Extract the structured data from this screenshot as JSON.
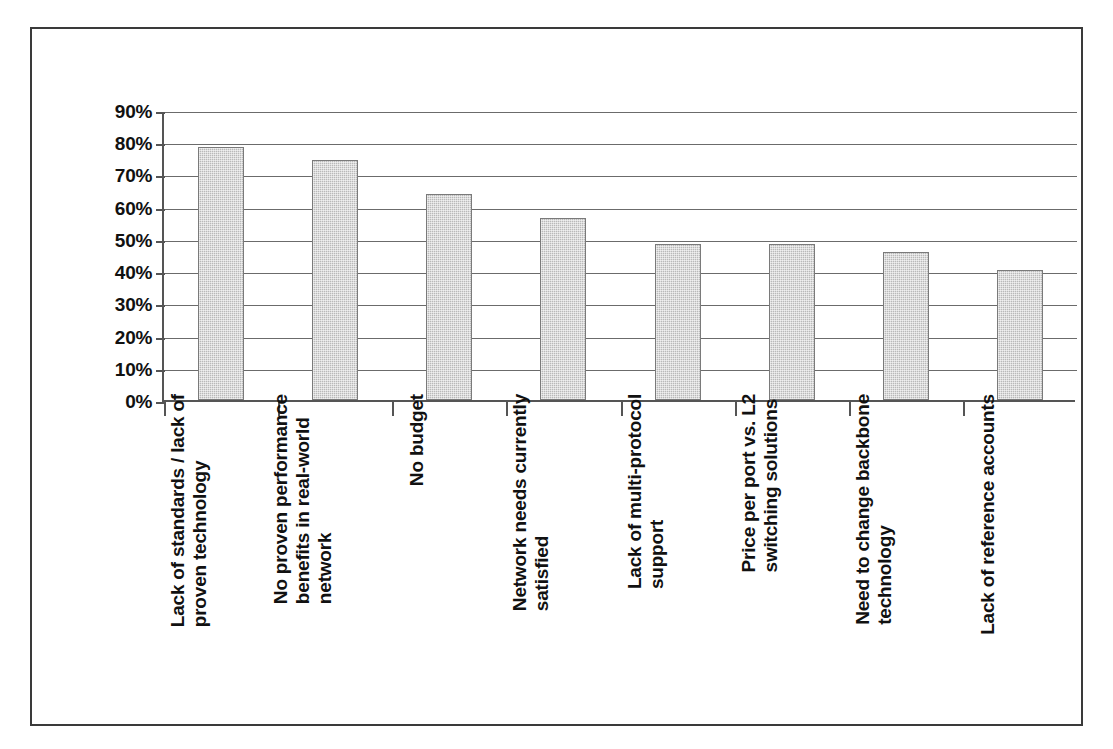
{
  "chart_data": {
    "type": "bar",
    "title": "",
    "subtitle": "",
    "xlabel": "",
    "ylabel": "",
    "ylim": [
      0,
      90
    ],
    "grid": true,
    "legend_position": "none",
    "orientation": "vertical",
    "bar_color": "#b9b9b9",
    "bar_border_color": "#7a7a7a",
    "axis_color": "#555555",
    "frame_color": "#3a3a3a",
    "ytick_labels": [
      "90%",
      "80%",
      "70%",
      "60%",
      "50%",
      "40%",
      "30%",
      "20%",
      "10%",
      "0%"
    ],
    "ytick_values": [
      90,
      80,
      70,
      60,
      50,
      40,
      30,
      20,
      10,
      0
    ],
    "categories": [
      "Lack of standards / lack of proven technology",
      "No proven performance benefits in real-world network",
      "No budget",
      "Network needs currently satisfied",
      "Lack of multi-protocol support",
      "Price per port vs. L2 switching solutions",
      "Need to change backbone technology",
      "Lack of reference accounts"
    ],
    "category_lines": [
      [
        "Lack of standards / lack of",
        "proven technology"
      ],
      [
        "No proven performance",
        "benefits in real-world",
        "network"
      ],
      [
        "No budget"
      ],
      [
        "Network needs currently",
        "satisfied"
      ],
      [
        "Lack of multi-protocol",
        "support"
      ],
      [
        "Price per port vs. L2",
        "switching solutions"
      ],
      [
        "Need to change backbone",
        "technology"
      ],
      [
        "Lack of reference accounts"
      ]
    ],
    "values": [
      78.5,
      74.5,
      64,
      56.5,
      48.5,
      48.5,
      46,
      40.5
    ],
    "value_labels": [
      "78.5%",
      "74.5%",
      "64%",
      "56.5%",
      "48.5%",
      "48.5%",
      "46%",
      "40.5%"
    ]
  }
}
